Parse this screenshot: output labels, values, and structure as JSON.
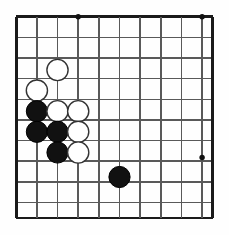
{
  "diagram": {
    "type": "go-board",
    "board": {
      "x_left": 16.2,
      "y_top": 16.8,
      "x_right": 212.5,
      "y_bottom": 218.0,
      "spacing": 20.65,
      "columns": 10,
      "rows": 10,
      "edge_color": "#1a1a1a",
      "line_color": "#595959",
      "edge_width": 2.6,
      "line_width": 1.5,
      "background": "#fefefe"
    },
    "vertical_lines_x": [
      16.2,
      36.9,
      57.5,
      78.2,
      98.8,
      119.5,
      140.1,
      160.8,
      181.4,
      202.1,
      212.5
    ],
    "horizontal_lines_y": [
      16.8,
      37.4,
      58.0,
      78.7,
      99.3,
      119.9,
      140.6,
      161.2,
      181.8,
      202.5,
      218.0
    ],
    "star_points": [
      {
        "name": "star-point-top-left",
        "x": 78.2,
        "y": 16.8,
        "r": 2.7
      },
      {
        "name": "star-point-top-right",
        "x": 202.1,
        "y": 16.8,
        "r": 2.7
      },
      {
        "name": "star-point-right",
        "x": 202.1,
        "y": 157.5,
        "r": 2.7
      }
    ],
    "stone_radius": 10.6,
    "stones": [
      {
        "id": "white-1",
        "color": "white",
        "x": 57.5,
        "y": 70.0,
        "label": ""
      },
      {
        "id": "white-2",
        "color": "white",
        "x": 36.9,
        "y": 90.6,
        "label": ""
      },
      {
        "id": "black-1",
        "color": "black",
        "x": 36.9,
        "y": 111.2,
        "label": ""
      },
      {
        "id": "white-3",
        "color": "white",
        "x": 57.5,
        "y": 111.2,
        "label": ""
      },
      {
        "id": "white-4",
        "color": "white",
        "x": 78.2,
        "y": 111.2,
        "label": ""
      },
      {
        "id": "black-2",
        "color": "black",
        "x": 36.9,
        "y": 131.8,
        "label": ""
      },
      {
        "id": "black-3",
        "color": "black",
        "x": 57.5,
        "y": 131.8,
        "label": ""
      },
      {
        "id": "white-5",
        "color": "white",
        "x": 78.2,
        "y": 131.8,
        "label": ""
      },
      {
        "id": "black-4",
        "color": "black",
        "x": 57.5,
        "y": 152.5,
        "label": ""
      },
      {
        "id": "white-6",
        "color": "white",
        "x": 78.2,
        "y": 152.5,
        "label": ""
      },
      {
        "id": "black-5",
        "color": "black",
        "x": 119.5,
        "y": 177.0,
        "label": ""
      }
    ],
    "colors": {
      "black_stone_fill": "#111111",
      "black_stone_stroke": "#000000",
      "white_stone_fill": "#ffffff",
      "white_stone_stroke": "#333333"
    }
  }
}
